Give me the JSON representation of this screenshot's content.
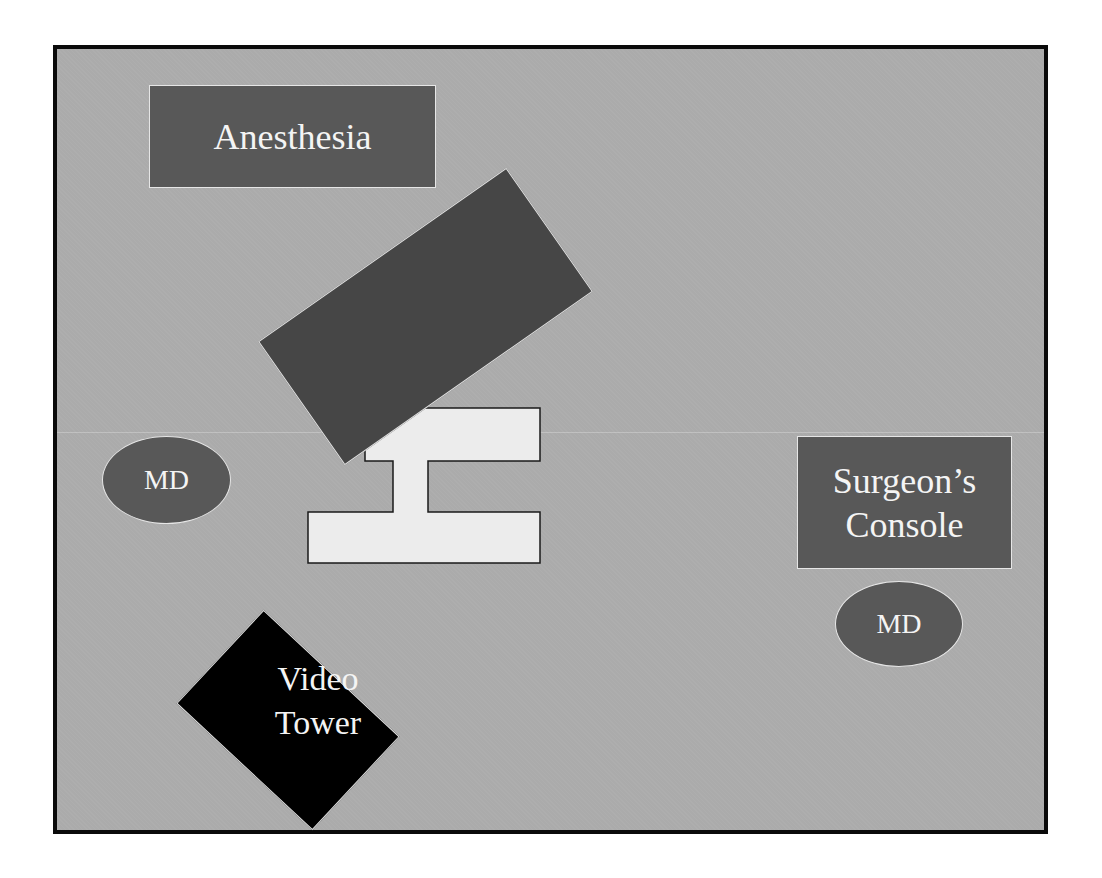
{
  "diagram": {
    "colors": {
      "floor": "#ababab",
      "station": "#585858",
      "bed": "#464646",
      "table": "#ececec",
      "video_tower": "#000000",
      "border": "#0a0a0a",
      "label_text": "#f4f4f4"
    },
    "stations": {
      "anesthesia": {
        "label": "Anesthesia"
      },
      "surgeon_console": {
        "label_line1": "Surgeon’s",
        "label_line2": "Console"
      },
      "md_left": {
        "label": "MD"
      },
      "md_right": {
        "label": "MD"
      },
      "video_tower": {
        "label_line1": "Video",
        "label_line2": "Tower"
      }
    },
    "objects": {
      "patient_cart": {
        "label": ""
      },
      "operating_table": {
        "label": ""
      }
    }
  }
}
